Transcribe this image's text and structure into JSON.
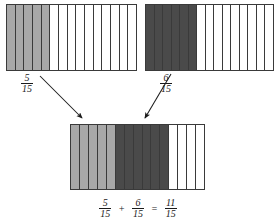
{
  "diagram": {
    "denominator": 15,
    "bars": [
      {
        "id": "bar-top-left",
        "name": "first-addend-bar",
        "total_parts": 15,
        "shaded_parts": 5,
        "shade_color": "#a8a8a8",
        "shade_style": "light",
        "label": {
          "numerator": "5",
          "denominator": "15"
        }
      },
      {
        "id": "bar-top-right",
        "name": "second-addend-bar",
        "total_parts": 15,
        "shaded_parts": 6,
        "shade_color": "#4a4a4a",
        "shade_style": "dark",
        "label": {
          "numerator": "6",
          "denominator": "15"
        }
      },
      {
        "id": "bar-sum",
        "name": "sum-bar",
        "total_parts": 15,
        "light_parts": 5,
        "dark_parts": 6,
        "empty_parts": 4,
        "label": {
          "numerator": "11",
          "denominator": "15"
        }
      }
    ],
    "equation": {
      "first": {
        "numerator": "5",
        "denominator": "15"
      },
      "plus": "+",
      "second": {
        "numerator": "6",
        "denominator": "15"
      },
      "equals": "=",
      "result": {
        "numerator": "11",
        "denominator": "15"
      }
    },
    "arrows": [
      {
        "name": "arrow-from-first-addend",
        "from_x": 40,
        "from_y": 76,
        "to_x": 83,
        "to_y": 119
      },
      {
        "name": "arrow-from-second-addend",
        "from_x": 171,
        "from_y": 74,
        "to_x": 144,
        "to_y": 119
      }
    ],
    "colors": {
      "light_shade": "#a8a8a8",
      "dark_shade": "#4a4a4a",
      "outline": "#3a3a3a",
      "background": "#ffffff",
      "text": "#1a1a1a"
    }
  }
}
